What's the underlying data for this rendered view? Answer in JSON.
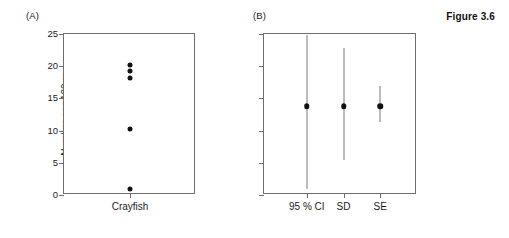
{
  "figure": {
    "title": "Figure 3.6",
    "panel_a_label": "(A)",
    "panel_b_label": "(B)"
  },
  "axis": {
    "y_title": "Number per 100 m",
    "y_ticks": [
      0,
      5,
      10,
      15,
      20,
      25
    ],
    "y_min": 0,
    "y_max": 25
  },
  "chart_data": [
    {
      "type": "scatter",
      "panel": "(A)",
      "title": "",
      "xlabel": "",
      "ylabel": "Number per 100 m",
      "ylim": [
        0,
        25
      ],
      "y_ticks": [
        0,
        5,
        10,
        15,
        20,
        25
      ],
      "grid": false,
      "legend": false,
      "categories": [
        "Crayfish"
      ],
      "x_tick_labels": [
        "Crayfish"
      ],
      "points": [
        {
          "category": "Crayfish",
          "value": 20.2
        },
        {
          "category": "Crayfish",
          "value": 19.2
        },
        {
          "category": "Crayfish",
          "value": 18.2
        },
        {
          "category": "Crayfish",
          "value": 10.2
        },
        {
          "category": "Crayfish",
          "value": 0.9
        }
      ]
    },
    {
      "type": "scatter",
      "panel": "(B)",
      "title": "",
      "xlabel": "",
      "ylabel": "Number per 100 m",
      "ylim": [
        0,
        25
      ],
      "y_ticks": [
        0,
        5,
        10,
        15,
        20,
        25
      ],
      "grid": false,
      "legend": false,
      "categories": [
        "95 % CI",
        "SD",
        "SE"
      ],
      "x_tick_labels": [
        "95 % CI",
        "SD",
        "SE"
      ],
      "series": [
        {
          "name": "mean with error bars",
          "values": [
            13.8,
            13.8,
            13.8
          ],
          "error_low": [
            1.0,
            5.5,
            11.4
          ],
          "error_high": [
            24.8,
            22.9,
            17.0
          ]
        }
      ],
      "points": [
        {
          "category": "95 % CI",
          "mean": 13.8,
          "lower": 1.0,
          "upper": 24.8
        },
        {
          "category": "SD",
          "mean": 13.8,
          "lower": 5.5,
          "upper": 22.9
        },
        {
          "category": "SE",
          "mean": 13.8,
          "lower": 11.4,
          "upper": 17.0
        }
      ]
    }
  ],
  "colors": {
    "marker": "#111111",
    "axis": "#6e6e6e",
    "errorbar": "#7a7a7a",
    "text": "#1a1a1a",
    "background": "#ffffff"
  }
}
